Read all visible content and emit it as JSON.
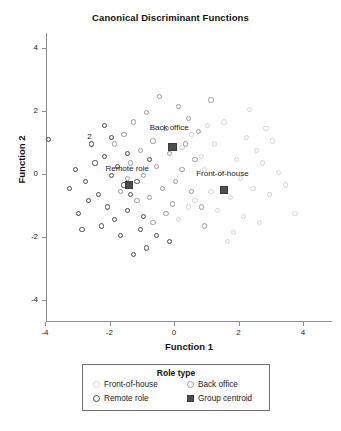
{
  "chart_data": {
    "type": "scatter",
    "title": "Canonical Discriminant Functions",
    "xlabel": "Function 1",
    "ylabel": "Function 2",
    "xlim": [
      -5,
      5
    ],
    "ylim": [
      -5,
      5
    ],
    "xticks": [
      "-4",
      "-2",
      "0",
      "2",
      "4"
    ],
    "xtick_values": [
      -4,
      -2,
      0,
      2,
      4
    ],
    "yticks": [
      "4",
      "2",
      "0",
      "-2",
      "-4"
    ],
    "ytick_values": [
      4,
      2,
      0,
      -2,
      -4
    ],
    "grid": false,
    "legend_position": "below-plot",
    "annotations": [
      {
        "text": "2",
        "x": -2.6,
        "y": 1.15
      }
    ],
    "series": [
      {
        "name": "Front-of-house",
        "marker": "open-circle",
        "color": "#d2d2d2",
        "points": [
          [
            1.05,
            1.55
          ],
          [
            1.55,
            1.65
          ],
          [
            2.25,
            1.15
          ],
          [
            2.55,
            0.75
          ],
          [
            1.25,
            0.95
          ],
          [
            0.85,
            0.55
          ],
          [
            1.95,
            0.45
          ],
          [
            2.75,
            0.35
          ],
          [
            0.95,
            0.15
          ],
          [
            1.45,
            0.05
          ],
          [
            2.05,
            -0.15
          ],
          [
            2.45,
            -0.45
          ],
          [
            1.15,
            -0.55
          ],
          [
            1.75,
            -0.75
          ],
          [
            0.65,
            -0.85
          ],
          [
            2.95,
            -0.65
          ],
          [
            1.35,
            -1.15
          ],
          [
            2.15,
            -1.35
          ],
          [
            0.45,
            -1.05
          ],
          [
            3.25,
            0.05
          ],
          [
            3.45,
            -0.35
          ],
          [
            2.65,
            -1.55
          ],
          [
            1.85,
            -1.85
          ],
          [
            0.25,
            0.85
          ],
          [
            0.55,
            1.25
          ],
          [
            3.05,
            1.05
          ],
          [
            2.35,
            2.05
          ],
          [
            1.65,
            -2.15
          ],
          [
            3.75,
            -1.25
          ],
          [
            0.15,
            -1.45
          ],
          [
            2.85,
            1.45
          ]
        ]
      },
      {
        "name": "Back office",
        "marker": "open-circle",
        "color": "#9a9a9a",
        "points": [
          [
            -0.45,
            2.45
          ],
          [
            0.15,
            2.15
          ],
          [
            -0.85,
            1.95
          ],
          [
            0.45,
            1.75
          ],
          [
            -1.25,
            1.65
          ],
          [
            -0.25,
            1.45
          ],
          [
            0.75,
            1.35
          ],
          [
            -1.55,
            1.25
          ],
          [
            -0.65,
            1.05
          ],
          [
            0.35,
            0.95
          ],
          [
            -1.05,
            0.75
          ],
          [
            -0.15,
            0.65
          ],
          [
            0.65,
            0.45
          ],
          [
            -1.35,
            0.35
          ],
          [
            -0.55,
            0.25
          ],
          [
            0.25,
            0.15
          ],
          [
            -0.95,
            -0.05
          ],
          [
            0.05,
            -0.25
          ],
          [
            -1.45,
            -0.15
          ],
          [
            -0.35,
            -0.45
          ],
          [
            0.55,
            -0.55
          ],
          [
            -0.75,
            -0.75
          ],
          [
            -0.05,
            -0.95
          ],
          [
            -1.15,
            -0.85
          ],
          [
            0.85,
            -1.05
          ],
          [
            -0.25,
            -1.25
          ],
          [
            -1.65,
            -0.55
          ],
          [
            -0.65,
            -1.55
          ],
          [
            0.95,
            -1.65
          ],
          [
            -1.85,
            0.95
          ],
          [
            1.15,
            2.35
          ]
        ]
      },
      {
        "name": "Remote role",
        "marker": "open-circle",
        "color": "#4a4a4a",
        "points": [
          [
            -3.9,
            1.1
          ],
          [
            -3.05,
            0.15
          ],
          [
            -2.45,
            0.35
          ],
          [
            -2.75,
            -0.25
          ],
          [
            -2.15,
            0.55
          ],
          [
            -1.95,
            -0.05
          ],
          [
            -2.35,
            -0.65
          ],
          [
            -1.75,
            0.25
          ],
          [
            -1.55,
            -0.35
          ],
          [
            -2.05,
            -1.05
          ],
          [
            -1.35,
            -0.65
          ],
          [
            -2.65,
            -0.85
          ],
          [
            -1.15,
            -0.25
          ],
          [
            -1.85,
            -1.45
          ],
          [
            -1.45,
            -1.15
          ],
          [
            -0.95,
            -1.35
          ],
          [
            -2.25,
            -1.65
          ],
          [
            -1.65,
            -1.95
          ],
          [
            -1.05,
            -1.75
          ],
          [
            -2.95,
            -1.25
          ],
          [
            -0.85,
            -2.35
          ],
          [
            -1.25,
            -2.55
          ],
          [
            -3.25,
            -0.45
          ],
          [
            -2.55,
            0.95
          ],
          [
            -1.95,
            1.15
          ],
          [
            -0.55,
            -1.95
          ],
          [
            -0.15,
            -2.15
          ],
          [
            -2.85,
            -1.75
          ],
          [
            -1.45,
            0.65
          ],
          [
            -0.75,
            0.45
          ],
          [
            -2.15,
            1.55
          ]
        ]
      }
    ],
    "centroids": [
      {
        "label": "Back office",
        "x": -0.05,
        "y": 0.85,
        "label_dx": -0.1,
        "label_dy": 0.62
      },
      {
        "label": "Remote role",
        "x": -1.4,
        "y": -0.35,
        "label_dx": -0.05,
        "label_dy": 0.5
      },
      {
        "label": "Front-of-house",
        "x": 1.55,
        "y": -0.5,
        "label_dx": -0.05,
        "label_dy": 0.5
      }
    ]
  },
  "legend": {
    "title": "Role type",
    "entries": [
      {
        "label": "Front-of-house",
        "marker": "open-circle",
        "color": "#d2d2d2"
      },
      {
        "label": "Back office",
        "marker": "open-circle",
        "color": "#9a9a9a"
      },
      {
        "label": "Remote role",
        "marker": "open-circle",
        "color": "#4a4a4a"
      },
      {
        "label": "Group centroid",
        "marker": "filled-square",
        "color": "#4d4d4d"
      }
    ]
  }
}
